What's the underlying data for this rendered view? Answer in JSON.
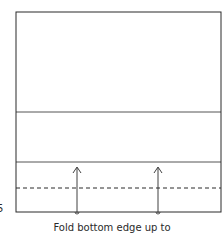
{
  "diagram": {
    "step_number": "5",
    "caption": "Fold bottom edge up to",
    "colors": {
      "line": "#2a2a2a",
      "background": "#ffffff"
    },
    "paper": {
      "left": 16,
      "top": 12,
      "right": 221,
      "bottom": 212
    },
    "crease_lines_y": [
      112,
      162
    ],
    "dashed_fold_line_y": 188,
    "arrows": [
      {
        "x": 77,
        "from_y": 213,
        "to_y": 167,
        "direction": "up"
      },
      {
        "x": 158,
        "from_y": 213,
        "to_y": 167,
        "direction": "up"
      }
    ]
  }
}
